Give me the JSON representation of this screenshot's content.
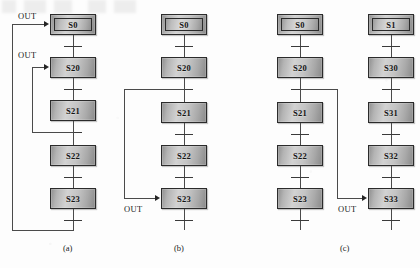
{
  "figure": {
    "width": 420,
    "height": 268,
    "background": "#fdfdfd",
    "line_color": "#4a4a4a",
    "box_border_color": "#2b2b2b"
  },
  "panels": [
    {
      "id": "panel-a",
      "caption": "(a)",
      "chains": [
        {
          "id": "chain-a-main",
          "states": [
            {
              "name": "S0",
              "initial": true
            },
            {
              "name": "S20",
              "initial": false
            },
            {
              "name": "S21",
              "initial": false
            },
            {
              "name": "S22",
              "initial": false
            },
            {
              "name": "S23",
              "initial": false
            }
          ]
        }
      ],
      "out_labels": [
        {
          "id": "out-a-1",
          "text": "OUT",
          "target": "S0"
        },
        {
          "id": "out-a-2",
          "text": "OUT",
          "target": "S20"
        }
      ]
    },
    {
      "id": "panel-b",
      "caption": "(b)",
      "chains": [
        {
          "id": "chain-b-main",
          "states": [
            {
              "name": "S0",
              "initial": true
            },
            {
              "name": "S20",
              "initial": false
            },
            {
              "name": "S21",
              "initial": false
            },
            {
              "name": "S22",
              "initial": false
            },
            {
              "name": "S23",
              "initial": false
            }
          ]
        }
      ],
      "out_labels": [
        {
          "id": "out-b-1",
          "text": "OUT",
          "target": "S23"
        }
      ]
    },
    {
      "id": "panel-c",
      "caption": "(c)",
      "chains": [
        {
          "id": "chain-c-left",
          "states": [
            {
              "name": "S0",
              "initial": true
            },
            {
              "name": "S20",
              "initial": false
            },
            {
              "name": "S21",
              "initial": false
            },
            {
              "name": "S22",
              "initial": false
            },
            {
              "name": "S23",
              "initial": false
            }
          ]
        },
        {
          "id": "chain-c-right",
          "states": [
            {
              "name": "S1",
              "initial": true
            },
            {
              "name": "S30",
              "initial": false
            },
            {
              "name": "S31",
              "initial": false
            },
            {
              "name": "S32",
              "initial": false
            },
            {
              "name": "S33",
              "initial": false
            }
          ]
        }
      ],
      "out_labels": [
        {
          "id": "out-c-1",
          "text": "OUT",
          "target": "S33"
        }
      ]
    }
  ]
}
